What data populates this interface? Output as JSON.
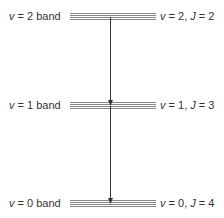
{
  "bands": [
    {
      "left_label": "v = 2 band",
      "left_var": "v",
      "left_rest": " = 2 band",
      "right_label": "v = 2, J = 2",
      "right_v": "v",
      "right_v_rest": " = 2, ",
      "right_j": "J",
      "right_j_rest": " = 2"
    },
    {
      "left_label": "v = 1 band",
      "left_var": "v",
      "left_rest": " = 1 band",
      "right_label": "v = 1, J = 3",
      "right_v": "v",
      "right_v_rest": " = 1, ",
      "right_j": "J",
      "right_j_rest": " = 3"
    },
    {
      "left_label": "v = 0 band",
      "left_var": "v",
      "left_rest": " = 0 band",
      "right_label": "v = 0, J = 4",
      "right_v": "v",
      "right_v_rest": " = 0, ",
      "right_j": "J",
      "right_j_rest": " = 4"
    }
  ],
  "arrows": [
    {
      "from": "v = 2, J = 2",
      "to": "v = 1, J = 3"
    },
    {
      "from": "v = 1, J = 3",
      "to": "v = 0, J = 4"
    }
  ],
  "colors": {
    "line": "#888888",
    "arrow": "#333333",
    "text": "#333333"
  }
}
